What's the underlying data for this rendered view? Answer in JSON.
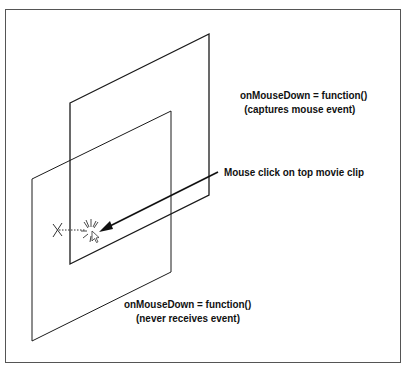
{
  "diagram": {
    "top_clip": {
      "line1": "onMouseDown = function()",
      "line2": "(captures mouse event)"
    },
    "bottom_clip": {
      "line1": "onMouseDown = function()",
      "line2": "(never receives event)"
    },
    "click_label": "Mouse click on top movie clip",
    "icons": [
      "x-mark-icon",
      "click-burst-icon",
      "cursor-icon",
      "arrow-icon"
    ],
    "colors": {
      "stroke": "#1a1a1a",
      "frame": "#555555",
      "background": "#ffffff"
    }
  }
}
